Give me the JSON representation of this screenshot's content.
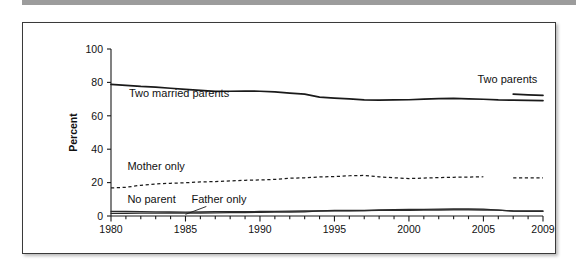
{
  "page": {
    "top_rule_color": "#9c9c9c",
    "frame_border_color": "#3a3a3a",
    "background": "#ffffff"
  },
  "chart_data": {
    "type": "line",
    "title": "",
    "subtitle": "",
    "xlabel": "",
    "ylabel": "Percent",
    "xlim": [
      1980,
      2009
    ],
    "ylim": [
      0,
      100
    ],
    "grid": false,
    "legend_position": "inline-annotations",
    "x_ticks": [
      1980,
      1985,
      1990,
      1995,
      2000,
      2005,
      2009
    ],
    "x_tick_labels": [
      "1980",
      "1985",
      "1990",
      "1995",
      "2000",
      "2005",
      "2009"
    ],
    "x_minor_ticks": [
      1981,
      1982,
      1983,
      1984,
      1986,
      1987,
      1988,
      1989,
      1991,
      1992,
      1993,
      1994,
      1996,
      1997,
      1998,
      1999,
      2001,
      2002,
      2003,
      2004,
      2006,
      2007,
      2008
    ],
    "y_ticks": [
      0,
      20,
      40,
      60,
      80,
      100
    ],
    "y_tick_labels": [
      "0",
      "20",
      "40",
      "60",
      "80",
      "100"
    ],
    "x": [
      1980,
      1981,
      1982,
      1983,
      1984,
      1985,
      1986,
      1987,
      1988,
      1989,
      1990,
      1991,
      1992,
      1993,
      1994,
      1995,
      1996,
      1997,
      1998,
      1999,
      2000,
      2001,
      2002,
      2003,
      2004,
      2005,
      2006,
      2007,
      2008,
      2009
    ],
    "series": [
      {
        "name": "Two married parents",
        "style": "solid",
        "label": "Two married parents",
        "label_x": 1981.2,
        "label_y": 71.0,
        "x": [
          1980,
          1981,
          1982,
          1983,
          1984,
          1985,
          1986,
          1987,
          1988,
          1989,
          1990,
          1991,
          1992,
          1993,
          1994,
          1995,
          1996,
          1997,
          1998,
          1999,
          2000,
          2001,
          2002,
          2003,
          2004,
          2005,
          2006,
          2007,
          2008,
          2009
        ],
        "values": [
          78.8,
          78.2,
          77.6,
          77.2,
          76.5,
          75.8,
          75.2,
          74.6,
          74.7,
          74.8,
          74.7,
          74.3,
          73.6,
          73.0,
          71.2,
          70.6,
          70.1,
          69.5,
          69.4,
          69.5,
          69.6,
          70.0,
          70.3,
          70.4,
          70.1,
          69.9,
          69.5,
          69.4,
          69.2,
          69.1
        ],
        "endpoints": {
          "start": 78.8,
          "end": 69.1
        }
      },
      {
        "name": "Two parents",
        "style": "solid",
        "label": "Two parents",
        "label_x": 2004.6,
        "label_y": 79.5,
        "x": [
          2007,
          2008,
          2009
        ],
        "values": [
          73.0,
          72.5,
          72.2
        ],
        "note": "Short segment introduced in 2007"
      },
      {
        "name": "Mother only",
        "style": "dashed",
        "label": "Mother only",
        "label_x": 1981.1,
        "label_y": 27.5,
        "x": [
          1980,
          1981,
          1982,
          1983,
          1984,
          1985,
          1986,
          1987,
          1988,
          1989,
          1990,
          1991,
          1992,
          1993,
          1994,
          1995,
          1996,
          1997,
          1998,
          1999,
          2000,
          2001,
          2002,
          2003,
          2004,
          2005,
          2007,
          2008,
          2009
        ],
        "values": [
          16.8,
          17.2,
          18.4,
          19.2,
          19.6,
          19.9,
          20.4,
          20.6,
          21.0,
          21.4,
          21.6,
          21.9,
          22.6,
          22.9,
          23.4,
          23.6,
          24.1,
          24.3,
          23.4,
          22.9,
          22.4,
          22.7,
          23.0,
          23.2,
          23.3,
          23.5,
          22.8,
          22.9,
          22.9
        ],
        "gap_after": 2005
      },
      {
        "name": "Father only",
        "style": "thin",
        "label": "Father only",
        "label_x": 1985.4,
        "label_y": 8.0,
        "leader_from": [
          1986.4,
          5.7
        ],
        "leader_to": [
          1985.0,
          1.0
        ],
        "x": [
          1980,
          1981,
          1982,
          1983,
          1984,
          1985,
          1986,
          1987,
          1988,
          1989,
          1990,
          1991,
          1992,
          1993,
          1994,
          1995,
          1996,
          1997,
          1998,
          1999,
          2000,
          2001,
          2002,
          2003,
          2004,
          2005,
          2006,
          2007,
          2008,
          2009
        ],
        "values": [
          1.6,
          1.6,
          1.7,
          1.7,
          1.7,
          1.7,
          1.8,
          1.9,
          2.0,
          2.1,
          2.2,
          2.3,
          2.4,
          2.5,
          3.1,
          3.3,
          3.3,
          3.3,
          3.4,
          3.4,
          3.4,
          3.5,
          3.6,
          3.7,
          3.7,
          3.6,
          3.5,
          3.0,
          3.0,
          3.0
        ]
      },
      {
        "name": "No parent",
        "style": "thin",
        "label": "No parent",
        "label_x": 1981.1,
        "label_y": 8.0,
        "x": [
          1980,
          1981,
          1982,
          1983,
          1984,
          1985,
          1986,
          1987,
          1988,
          1989,
          1990,
          1991,
          1992,
          1993,
          1994,
          1995,
          1996,
          1997,
          1998,
          1999,
          2000,
          2001,
          2002,
          2003,
          2004,
          2005,
          2006,
          2007,
          2008,
          2009
        ],
        "values": [
          2.8,
          2.7,
          2.6,
          2.5,
          2.4,
          2.3,
          2.5,
          2.6,
          2.6,
          2.6,
          2.7,
          2.8,
          2.9,
          3.0,
          3.0,
          3.1,
          3.1,
          3.2,
          3.6,
          3.8,
          3.9,
          4.0,
          4.1,
          4.2,
          4.2,
          4.1,
          3.5,
          2.9,
          2.8,
          2.8
        ]
      }
    ]
  }
}
